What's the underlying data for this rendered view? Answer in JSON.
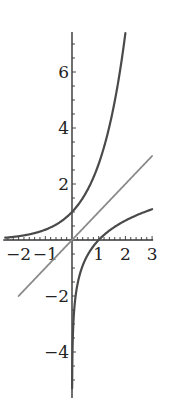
{
  "chart_data": {
    "type": "line",
    "title": "",
    "xlabel": "",
    "ylabel": "",
    "xlim": [
      -2.5,
      3
    ],
    "ylim": [
      -5.5,
      7.5
    ],
    "grid": false,
    "legend": null,
    "x_ticks": [
      -2,
      -1,
      1,
      2,
      3
    ],
    "x_tick_labels": [
      "−2",
      "−1",
      "1",
      "2",
      "3"
    ],
    "y_ticks": [
      -4,
      -2,
      2,
      4,
      6
    ],
    "y_tick_labels": [
      "−4",
      "−2",
      "2",
      "4",
      "6"
    ],
    "series": [
      {
        "name": "exp(x)",
        "function": "e^x",
        "domain": [
          -2.5,
          2.0
        ],
        "color": "#4a4a4a",
        "points": [
          [
            -2.5,
            0.08
          ],
          [
            -2,
            0.14
          ],
          [
            -1,
            0.37
          ],
          [
            0,
            1
          ],
          [
            1,
            2.72
          ],
          [
            1.5,
            4.48
          ],
          [
            2,
            7.39
          ]
        ]
      },
      {
        "name": "x",
        "function": "y = x",
        "domain": [
          -2,
          3
        ],
        "color": "#8a8a8a",
        "points": [
          [
            -2,
            -2
          ],
          [
            0,
            0
          ],
          [
            3,
            3
          ]
        ]
      },
      {
        "name": "ln(x)",
        "function": "ln x",
        "domain": [
          0.005,
          3
        ],
        "color": "#4a4a4a",
        "points": [
          [
            0.005,
            -5.3
          ],
          [
            0.1,
            -2.3
          ],
          [
            0.5,
            -0.69
          ],
          [
            1,
            0
          ],
          [
            2,
            0.69
          ],
          [
            3,
            1.1
          ]
        ]
      }
    ]
  }
}
